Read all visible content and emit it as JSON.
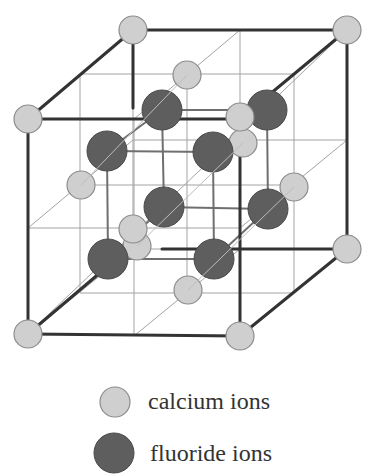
{
  "colors": {
    "calcium_fill": "#cfcfcf",
    "calcium_stroke": "#8c8c8c",
    "fluoride_fill": "#5e5e5e",
    "fluoride_stroke": "#4a4a4a",
    "bold_edge": "#333333",
    "thin_line": "#9a9a9a"
  },
  "legend": {
    "items": [
      {
        "label": "calcium ions",
        "type": "calcium"
      },
      {
        "label": "fluoride ions",
        "type": "fluoride"
      }
    ]
  },
  "lattice": {
    "calcium_positions": [
      "corner-back-top-left",
      "corner-back-top-right",
      "corner-front-top-left",
      "corner-front-top-right",
      "corner-back-bottom-right",
      "corner-front-bottom-left",
      "corner-front-bottom-right",
      "face-top",
      "face-left",
      "face-right",
      "face-bottom",
      "face-front",
      "face-back"
    ],
    "fluoride_count": 8
  }
}
